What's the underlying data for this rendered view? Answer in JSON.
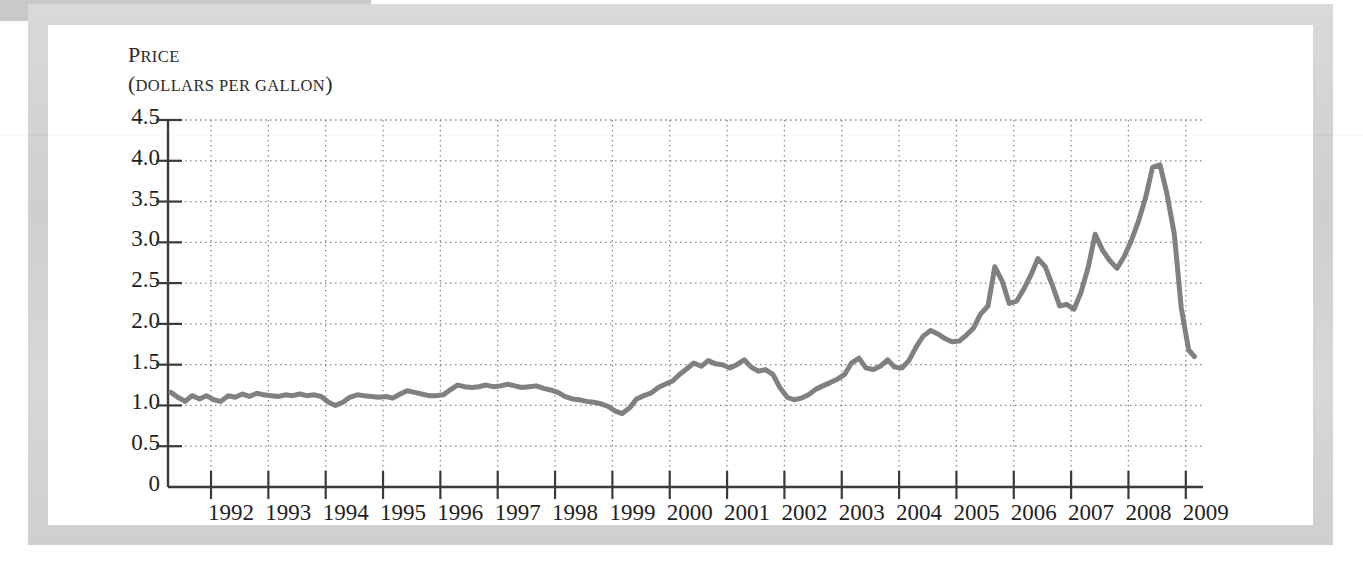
{
  "page": {
    "background_color": "#ffffff",
    "frame_color": "#cfcfcf",
    "inner_color": "#ffffff"
  },
  "axis_title": {
    "line1_lead": "P",
    "line1_rest": "RICE",
    "line2_lead": "(",
    "line2_rest_a": "DOLLARS PER GALLON",
    "line2_close": ")"
  },
  "chart_data": {
    "type": "line",
    "title": "",
    "subtitle": "",
    "xlabel": "",
    "ylabel": "Price (dollars per gallon)",
    "ylabel_line1": "PRICE",
    "ylabel_line2": "(DOLLARS PER GALLON)",
    "grid": true,
    "legend": "none",
    "line_color": "#808080",
    "line_width": 5,
    "axis_color": "#3a3a3a",
    "grid_color": "#8c8c8c",
    "xlim": [
      1991.25,
      2009.3
    ],
    "ylim": [
      0,
      4.5
    ],
    "yticks": [
      0,
      0.5,
      1.0,
      1.5,
      2.0,
      2.5,
      3.0,
      3.5,
      4.0,
      4.5
    ],
    "ytick_labels": [
      "0",
      "0.5",
      "1.0",
      "1.5",
      "2.0",
      "2.5",
      "3.0",
      "3.5",
      "4.0",
      "4.5"
    ],
    "xticks": [
      1992,
      1993,
      1994,
      1995,
      1996,
      1997,
      1998,
      1999,
      2000,
      2001,
      2002,
      2003,
      2004,
      2005,
      2006,
      2007,
      2008,
      2009
    ],
    "xtick_labels": [
      "1992",
      "1993",
      "1994",
      "1995",
      "1996",
      "1997",
      "1998",
      "1999",
      "2000",
      "2001",
      "2002",
      "2003",
      "2004",
      "2005",
      "2006",
      "2007",
      "2008",
      "2009"
    ],
    "series": [
      {
        "name": "Gasoline price",
        "x": [
          1991.3,
          1991.42,
          1991.55,
          1991.67,
          1991.8,
          1991.92,
          1992.05,
          1992.17,
          1992.3,
          1992.42,
          1992.55,
          1992.67,
          1992.8,
          1992.92,
          1993.05,
          1993.17,
          1993.3,
          1993.42,
          1993.55,
          1993.67,
          1993.8,
          1993.92,
          1994.05,
          1994.17,
          1994.3,
          1994.42,
          1994.55,
          1994.67,
          1994.8,
          1994.92,
          1995.05,
          1995.17,
          1995.3,
          1995.42,
          1995.55,
          1995.67,
          1995.8,
          1995.92,
          1996.05,
          1996.17,
          1996.3,
          1996.42,
          1996.55,
          1996.67,
          1996.8,
          1996.92,
          1997.05,
          1997.17,
          1997.3,
          1997.42,
          1997.55,
          1997.67,
          1997.8,
          1997.92,
          1998.05,
          1998.17,
          1998.3,
          1998.42,
          1998.55,
          1998.67,
          1998.8,
          1998.92,
          1999.05,
          1999.17,
          1999.3,
          1999.42,
          1999.55,
          1999.67,
          1999.8,
          1999.92,
          2000.05,
          2000.17,
          2000.3,
          2000.42,
          2000.55,
          2000.67,
          2000.8,
          2000.92,
          2001.05,
          2001.17,
          2001.3,
          2001.42,
          2001.55,
          2001.67,
          2001.8,
          2001.92,
          2002.05,
          2002.17,
          2002.3,
          2002.42,
          2002.55,
          2002.67,
          2002.8,
          2002.92,
          2003.05,
          2003.17,
          2003.3,
          2003.42,
          2003.55,
          2003.67,
          2003.8,
          2003.92,
          2004.05,
          2004.17,
          2004.3,
          2004.42,
          2004.55,
          2004.67,
          2004.8,
          2004.92,
          2005.05,
          2005.17,
          2005.3,
          2005.42,
          2005.55,
          2005.67,
          2005.8,
          2005.92,
          2006.05,
          2006.17,
          2006.3,
          2006.42,
          2006.55,
          2006.67,
          2006.8,
          2006.92,
          2007.05,
          2007.17,
          2007.3,
          2007.42,
          2007.55,
          2007.67,
          2007.8,
          2007.92,
          2008.05,
          2008.17,
          2008.3,
          2008.42,
          2008.55,
          2008.67,
          2008.8,
          2008.92,
          2009.05,
          2009.15
        ],
        "y": [
          1.16,
          1.1,
          1.05,
          1.12,
          1.08,
          1.12,
          1.07,
          1.05,
          1.12,
          1.1,
          1.14,
          1.11,
          1.15,
          1.13,
          1.12,
          1.11,
          1.13,
          1.12,
          1.14,
          1.12,
          1.13,
          1.11,
          1.04,
          1.0,
          1.04,
          1.1,
          1.13,
          1.12,
          1.11,
          1.1,
          1.11,
          1.09,
          1.14,
          1.18,
          1.16,
          1.14,
          1.12,
          1.12,
          1.13,
          1.19,
          1.25,
          1.23,
          1.22,
          1.23,
          1.25,
          1.23,
          1.24,
          1.26,
          1.24,
          1.22,
          1.23,
          1.24,
          1.21,
          1.19,
          1.16,
          1.11,
          1.08,
          1.07,
          1.05,
          1.04,
          1.02,
          0.99,
          0.93,
          0.9,
          0.97,
          1.08,
          1.12,
          1.15,
          1.22,
          1.26,
          1.3,
          1.38,
          1.45,
          1.52,
          1.48,
          1.55,
          1.51,
          1.5,
          1.46,
          1.5,
          1.56,
          1.47,
          1.42,
          1.44,
          1.38,
          1.22,
          1.1,
          1.07,
          1.09,
          1.13,
          1.2,
          1.24,
          1.28,
          1.32,
          1.38,
          1.52,
          1.58,
          1.46,
          1.44,
          1.48,
          1.56,
          1.47,
          1.46,
          1.55,
          1.72,
          1.85,
          1.92,
          1.88,
          1.82,
          1.78,
          1.79,
          1.86,
          1.95,
          2.12,
          2.22,
          2.7,
          2.52,
          2.25,
          2.28,
          2.42,
          2.6,
          2.8,
          2.7,
          2.48,
          2.22,
          2.24,
          2.18,
          2.38,
          2.7,
          3.1,
          2.9,
          2.78,
          2.68,
          2.82,
          3.02,
          3.25,
          3.55,
          3.92,
          3.95,
          3.6,
          3.1,
          2.2,
          1.68,
          1.6
        ]
      }
    ]
  }
}
